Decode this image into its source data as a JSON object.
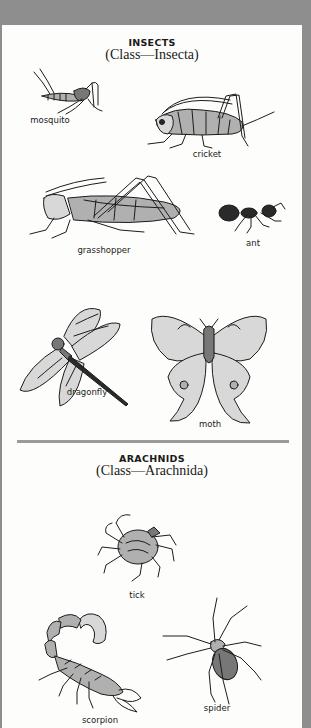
{
  "sections": [
    {
      "title": "INSECTS",
      "subtitle": "(Class—Insecta)",
      "specimens": [
        {
          "name": "mosquito"
        },
        {
          "name": "cricket"
        },
        {
          "name": "grasshopper"
        },
        {
          "name": "ant"
        },
        {
          "name": "dragonfly"
        },
        {
          "name": "moth"
        }
      ]
    },
    {
      "title": "ARACHNIDS",
      "subtitle": "(Class—Arachnida)",
      "specimens": [
        {
          "name": "tick"
        },
        {
          "name": "scorpion"
        },
        {
          "name": "spider"
        }
      ]
    }
  ],
  "colors": {
    "frame": "#8e8e8e",
    "page": "#fdfdfb",
    "divider": "#9a9a9a",
    "ink": "#1a1a1a"
  }
}
